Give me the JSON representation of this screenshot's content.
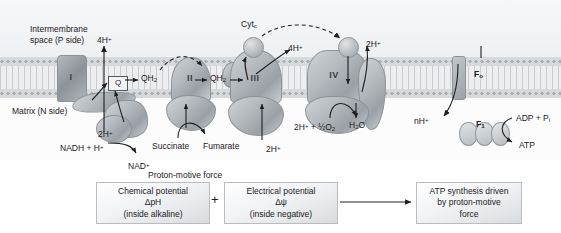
{
  "figure": {
    "compartments": {
      "upper": "Intermembrane\nspace (P side)",
      "upper_line1": "Intermembrane",
      "upper_line2": "space (P side)",
      "lower": "Matrix (N side)"
    },
    "complexes": [
      {
        "id": "I",
        "label": "I"
      },
      {
        "id": "II",
        "label": "II"
      },
      {
        "id": "III",
        "label": "III"
      },
      {
        "id": "IV",
        "label": "IV"
      }
    ],
    "carriers": {
      "q_box": "Q",
      "qh2_left": "QH",
      "qh2_left_sub": "2",
      "qh2_right": "QH",
      "qh2_right_sub": "2",
      "cytc": "Cyt",
      "cytc_sub": "c"
    },
    "proton_labels": {
      "complex_I_out": "4H",
      "complex_I_out_sup": "+",
      "complex_I_in": "2H",
      "complex_I_in_sup": "+",
      "complex_III_out": "4H",
      "complex_III_out_sup": "+",
      "complex_III_in": "2H",
      "complex_III_in_sup": "+",
      "complex_IV_out": "2H",
      "complex_IV_out_sup": "+",
      "synthase_in": "nH",
      "synthase_in_sup": "+"
    },
    "substrates": {
      "nadh": "NADH + H",
      "nadh_sup": "+",
      "nad": "NAD",
      "nad_sup": "+",
      "succinate": "Succinate",
      "fumarate": "Fumarate",
      "oxygen_reactants": "2H",
      "oxygen_reactants_sup": "+",
      "oxygen_mid": " + ",
      "oxygen_half": "½",
      "oxygen_o2": "O",
      "oxygen_o2_sub": "2",
      "water": "H",
      "water_sub": "2",
      "water_o": "O"
    },
    "atp_synthase": {
      "fo": "F",
      "fo_sub": "o",
      "f1": "F",
      "f1_sub": "1",
      "substrate": "ADP + P",
      "substrate_sub": "i",
      "product": "ATP"
    },
    "pmf": {
      "heading": "Proton-motive force",
      "chemical": {
        "line1": "Chemical potential",
        "line2": "ΔpH",
        "line3": "(inside alkaline)"
      },
      "operator": "+",
      "electrical": {
        "line1": "Electrical potential",
        "line2": "Δψ",
        "line3": "(inside negative)"
      },
      "result": {
        "line1": "ATP synthesis driven",
        "line2": "by proton-motive",
        "line3": "force"
      }
    },
    "colors": {
      "background": "#ffffff",
      "intermembrane_space": "#f2f4f5",
      "membrane_head": "#d7dadd",
      "membrane_tail": "#eceef0",
      "protein_fill": "#b7bcc0",
      "protein_stroke": "#8d9398",
      "text": "#1d2023",
      "arrow": "#1d2023"
    }
  }
}
